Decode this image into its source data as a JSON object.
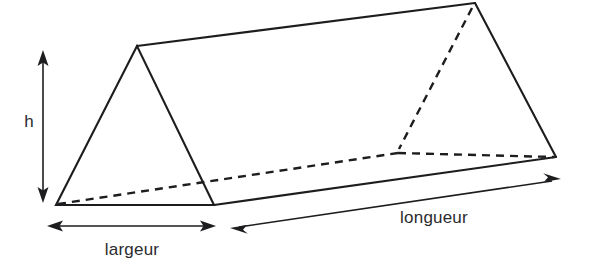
{
  "figure": {
    "name": "triangular-prism-diagram",
    "background_color": "#ffffff",
    "line_color": "#1d1d20",
    "text_color": "#2b2b2e"
  },
  "labels": {
    "height": "h",
    "width": "largeur",
    "length": "longueur"
  },
  "geometry": {
    "vertices": {
      "front_apex": [
        137,
        46
      ],
      "front_bottom_left": [
        56,
        205
      ],
      "front_bottom_right": [
        214,
        205
      ],
      "back_apex": [
        475,
        3
      ],
      "back_bottom_left": [
        398,
        153
      ],
      "back_bottom_right": [
        556,
        157
      ]
    },
    "solid_edges": [
      "front_apex -> front_bottom_left",
      "front_apex -> front_bottom_right",
      "front_bottom_left -> front_bottom_right",
      "front_apex -> back_apex",
      "back_apex -> back_bottom_right",
      "front_bottom_right -> back_bottom_right"
    ],
    "hidden_edges": [
      "front_bottom_left -> back_bottom_left",
      "back_bottom_left -> back_bottom_right",
      "back_apex -> back_bottom_left"
    ]
  },
  "dimensions": {
    "height": {
      "label": "h",
      "type": "double-arrow",
      "orientation": "vertical",
      "from": [
        43,
        52
      ],
      "to": [
        43,
        201
      ],
      "label_position": [
        28,
        126
      ]
    },
    "width": {
      "label": "largeur",
      "type": "double-arrow",
      "orientation": "horizontal",
      "from": [
        48,
        226
      ],
      "to": [
        215,
        226
      ],
      "label_position": [
        132,
        249
      ]
    },
    "length": {
      "label": "longueur",
      "type": "double-arrow",
      "orientation": "diagonal",
      "from": [
        231,
        228
      ],
      "to": [
        560,
        179
      ],
      "label_position": [
        434,
        222
      ]
    }
  }
}
